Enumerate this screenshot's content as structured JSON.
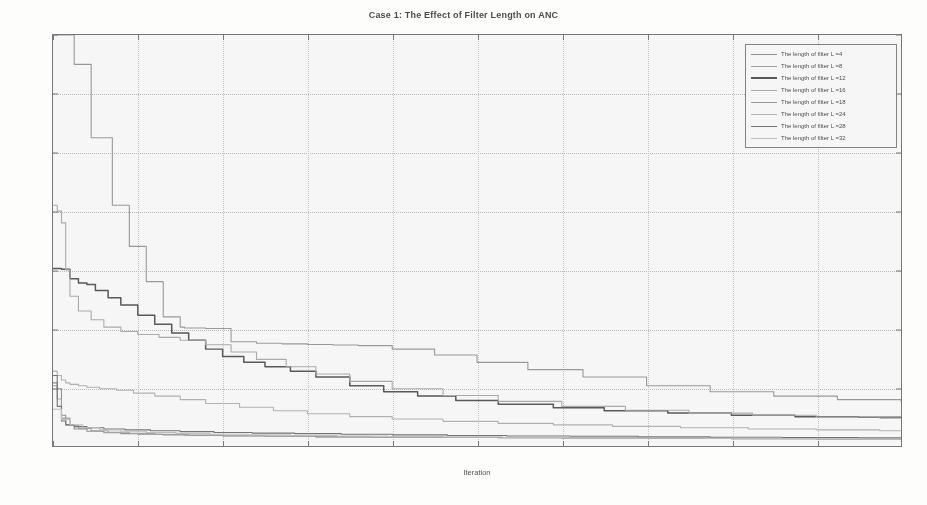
{
  "chart_data": {
    "type": "line",
    "title": "Case 1: The Effect of Filter Length on ANC",
    "xlabel": "Iteration",
    "ylabel": "Variance of Cost Function in MSE",
    "xlim": [
      0,
      200
    ],
    "ylim": [
      0,
      14
    ],
    "xticks": [
      0,
      20,
      40,
      60,
      80,
      100,
      120,
      140,
      160,
      180,
      200
    ],
    "yticks": [
      0,
      2,
      4,
      6,
      8,
      10,
      12,
      14
    ],
    "grid": true,
    "legend_position": "top-right",
    "legend_title_prefix": "The length of filter L =",
    "series": [
      {
        "name": "The length of filter L =4",
        "filter_length": 4,
        "color": "#8a8a8a",
        "x": [
          0,
          1,
          2,
          3,
          5,
          8,
          12,
          16,
          20,
          26,
          32,
          40,
          50,
          62,
          75,
          90,
          105,
          120,
          140,
          160,
          180,
          200
        ],
        "values": [
          2.15,
          1.95,
          1.05,
          0.72,
          0.58,
          0.5,
          0.45,
          0.42,
          0.4,
          0.38,
          0.36,
          0.34,
          0.33,
          0.31,
          0.3,
          0.29,
          0.28,
          0.27,
          0.26,
          0.25,
          0.24,
          0.24
        ]
      },
      {
        "name": "The length of filter L =8",
        "filter_length": 8,
        "color": "#9c9c9c",
        "x": [
          0,
          1,
          2,
          4,
          6,
          9,
          13,
          18,
          24,
          31,
          40,
          50,
          62,
          75,
          90,
          105,
          120,
          140,
          160,
          180,
          200
        ],
        "values": [
          2.05,
          1.6,
          0.95,
          0.7,
          0.6,
          0.52,
          0.47,
          0.43,
          0.4,
          0.37,
          0.35,
          0.33,
          0.31,
          0.3,
          0.29,
          0.28,
          0.27,
          0.26,
          0.25,
          0.24,
          0.23
        ]
      },
      {
        "name": "The length of filter L =12",
        "filter_length": 12,
        "color": "#4a4a4a",
        "x": [
          0,
          2,
          4,
          6,
          8,
          10,
          13,
          16,
          20,
          24,
          28,
          32,
          36,
          40,
          45,
          50,
          56,
          62,
          70,
          78,
          86,
          95,
          105,
          118,
          130,
          145,
          160,
          175,
          190,
          200
        ],
        "values": [
          6.05,
          6.02,
          5.7,
          5.55,
          5.5,
          5.3,
          5.05,
          4.8,
          4.45,
          4.15,
          3.85,
          3.6,
          3.3,
          3.05,
          2.85,
          2.7,
          2.55,
          2.35,
          2.05,
          1.85,
          1.7,
          1.55,
          1.42,
          1.3,
          1.2,
          1.12,
          1.05,
          1.0,
          0.98,
          0.97
        ]
      },
      {
        "name": "The length of filter L =16",
        "filter_length": 16,
        "color": "#a8a8a8",
        "x": [
          0,
          1,
          2,
          3,
          4,
          6,
          9,
          12,
          16,
          20,
          25,
          30,
          36,
          42,
          48,
          55,
          62,
          70,
          80,
          92,
          105,
          120,
          135,
          150,
          165,
          180,
          195,
          200
        ],
        "values": [
          8.2,
          8.0,
          7.6,
          6.0,
          5.1,
          4.6,
          4.3,
          4.05,
          3.9,
          3.8,
          3.7,
          3.6,
          3.45,
          3.2,
          2.95,
          2.7,
          2.45,
          2.2,
          1.95,
          1.72,
          1.52,
          1.35,
          1.22,
          1.12,
          1.05,
          0.99,
          0.95,
          0.94
        ]
      },
      {
        "name": "The length of filter L =18",
        "filter_length": 18,
        "color": "#949494",
        "x": [
          0,
          2,
          5,
          9,
          14,
          18,
          22,
          26,
          30,
          31,
          36,
          42,
          48,
          54,
          60,
          66,
          72,
          80,
          90,
          100,
          112,
          125,
          140,
          155,
          170,
          185,
          200
        ],
        "values": [
          14.0,
          14.0,
          13.0,
          10.5,
          8.2,
          6.8,
          5.6,
          4.4,
          4.05,
          4.02,
          4.0,
          3.55,
          3.5,
          3.48,
          3.46,
          3.44,
          3.42,
          3.3,
          3.1,
          2.85,
          2.6,
          2.35,
          2.05,
          1.85,
          1.7,
          1.58,
          1.52
        ]
      },
      {
        "name": "The length of filter L =24",
        "filter_length": 24,
        "color": "#b0b0b0",
        "x": [
          0,
          1,
          2,
          3,
          4,
          6,
          8,
          11,
          15,
          19,
          24,
          30,
          36,
          44,
          52,
          60,
          70,
          80,
          92,
          105,
          118,
          132,
          148,
          164,
          180,
          195,
          200
        ],
        "values": [
          2.55,
          2.4,
          2.25,
          2.15,
          2.1,
          2.05,
          2.0,
          1.95,
          1.9,
          1.8,
          1.7,
          1.58,
          1.45,
          1.32,
          1.2,
          1.1,
          1.0,
          0.92,
          0.84,
          0.77,
          0.72,
          0.67,
          0.62,
          0.58,
          0.55,
          0.52,
          0.51
        ]
      },
      {
        "name": "The length of filter L =28",
        "filter_length": 28,
        "color": "#6a6a6a",
        "x": [
          0,
          1,
          2,
          3,
          5,
          8,
          12,
          17,
          23,
          30,
          38,
          47,
          57,
          68,
          80,
          93,
          107,
          122,
          138,
          155,
          172,
          190,
          200
        ],
        "values": [
          2.4,
          1.35,
          0.85,
          0.72,
          0.66,
          0.62,
          0.58,
          0.55,
          0.52,
          0.49,
          0.46,
          0.44,
          0.42,
          0.4,
          0.38,
          0.36,
          0.34,
          0.33,
          0.31,
          0.3,
          0.29,
          0.28,
          0.28
        ]
      },
      {
        "name": "The length of filter L =32",
        "filter_length": 32,
        "color": "#bdbdbd",
        "x": [
          0,
          2,
          4,
          7,
          11,
          16,
          22,
          29,
          37,
          46,
          56,
          67,
          79,
          92,
          106,
          121,
          137,
          154,
          172,
          190,
          200
        ],
        "values": [
          1.25,
          0.9,
          0.72,
          0.62,
          0.55,
          0.5,
          0.46,
          0.43,
          0.4,
          0.38,
          0.36,
          0.34,
          0.32,
          0.31,
          0.29,
          0.28,
          0.27,
          0.26,
          0.25,
          0.24,
          0.24
        ]
      }
    ]
  }
}
